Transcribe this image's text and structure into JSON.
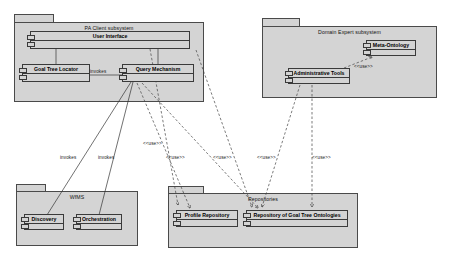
{
  "diagram": {
    "type": "uml-package-component-diagram",
    "background": "#ffffff",
    "package_fill": "#d4d4d4",
    "stroke": "#3a3a3a"
  },
  "packages": [
    {
      "id": "pa-client",
      "title": "PA Client subsystem",
      "x": 14,
      "y": 14,
      "w": 190,
      "h": 88
    },
    {
      "id": "domain-expert",
      "title": "Domain Expert subsystem",
      "x": 262,
      "y": 18,
      "w": 175,
      "h": 80
    },
    {
      "id": "wfms",
      "title": "WfMS",
      "x": 16,
      "y": 184,
      "w": 122,
      "h": 62
    },
    {
      "id": "repositories",
      "title": "Repositories",
      "x": 168,
      "y": 186,
      "w": 190,
      "h": 62
    }
  ],
  "components": [
    {
      "id": "user-interface",
      "label": "User Interface",
      "x": 30,
      "y": 31,
      "w": 160,
      "h": 18
    },
    {
      "id": "goal-tree-locator",
      "label": "Goal Tree Locator",
      "x": 22,
      "y": 64,
      "w": 68,
      "h": 18
    },
    {
      "id": "query-mechanism",
      "label": "Query Mechanism",
      "x": 122,
      "y": 64,
      "w": 72,
      "h": 18
    },
    {
      "id": "meta-ontology",
      "label": "Meta-Ontology",
      "x": 366,
      "y": 40,
      "w": 50,
      "h": 16
    },
    {
      "id": "administrative-tools",
      "label": "Administrative Tools",
      "x": 288,
      "y": 68,
      "w": 62,
      "h": 16
    },
    {
      "id": "discovery",
      "label": "Discovery",
      "x": 24,
      "y": 214,
      "w": 40,
      "h": 16
    },
    {
      "id": "orchestration",
      "label": "Orchestration",
      "x": 76,
      "y": 214,
      "w": 46,
      "h": 16
    },
    {
      "id": "profile-repository",
      "label": "Profile Repository",
      "x": 176,
      "y": 210,
      "w": 62,
      "h": 17
    },
    {
      "id": "goal-tree-ontologies",
      "label": "Repository of Goal Tree Ontologies",
      "x": 246,
      "y": 210,
      "w": 102,
      "h": 17
    }
  ],
  "edge_labels": [
    {
      "id": "lbl-invokes-qm",
      "text": "invokes",
      "x": 90,
      "y": 69
    },
    {
      "id": "lbl-invokes-discovery",
      "text": "invokes",
      "x": 60,
      "y": 155
    },
    {
      "id": "lbl-invokes-orch",
      "text": "invokes",
      "x": 98,
      "y": 155
    },
    {
      "id": "lbl-use-1",
      "text": "<<use>>",
      "x": 143,
      "y": 141
    },
    {
      "id": "lbl-use-2",
      "text": "<<use>>",
      "x": 166,
      "y": 155
    },
    {
      "id": "lbl-use-3",
      "text": "<<use>>",
      "x": 213,
      "y": 155
    },
    {
      "id": "lbl-use-4",
      "text": "<<use>>",
      "x": 257,
      "y": 155
    },
    {
      "id": "lbl-use-5",
      "text": "<<use>>",
      "x": 312,
      "y": 155
    },
    {
      "id": "lbl-use-6",
      "text": "<<use>>",
      "x": 361,
      "y": 65
    }
  ],
  "connections": [
    {
      "id": "conn-ui-gtl",
      "kind": "solid",
      "from": "user-interface",
      "to": "goal-tree-locator"
    },
    {
      "id": "conn-ui-qm",
      "kind": "solid",
      "from": "user-interface",
      "to": "query-mechanism"
    },
    {
      "id": "conn-gtl-qm",
      "kind": "solid",
      "from": "goal-tree-locator",
      "to": "query-mechanism",
      "label": "invokes"
    },
    {
      "id": "conn-qm-discovery",
      "kind": "solid",
      "from": "query-mechanism",
      "to": "discovery",
      "label": "invokes"
    },
    {
      "id": "conn-qm-orch",
      "kind": "solid",
      "from": "query-mechanism",
      "to": "orchestration",
      "label": "invokes"
    },
    {
      "id": "conn-ui-profile",
      "kind": "dashed",
      "from": "user-interface",
      "to": "profile-repository",
      "label": "<<use>>"
    },
    {
      "id": "conn-gtl-gto",
      "kind": "dashed",
      "from": "goal-tree-locator",
      "to": "goal-tree-ontologies",
      "label": "<<use>>"
    },
    {
      "id": "conn-qm-gto",
      "kind": "dashed",
      "from": "query-mechanism",
      "to": "goal-tree-ontologies",
      "label": "<<use>>"
    },
    {
      "id": "conn-qm-profile",
      "kind": "dashed",
      "from": "query-mechanism",
      "to": "profile-repository",
      "label": "<<use>>"
    },
    {
      "id": "conn-admin-gto",
      "kind": "dashed",
      "from": "administrative-tools",
      "to": "goal-tree-ontologies",
      "label": "<<use>>"
    },
    {
      "id": "conn-meta-gto",
      "kind": "dashed",
      "from": "meta-ontology",
      "to": "goal-tree-ontologies",
      "label": "<<use>>"
    },
    {
      "id": "conn-admin-meta",
      "kind": "dashed",
      "from": "administrative-tools",
      "to": "meta-ontology",
      "label": "<<use>>"
    }
  ]
}
